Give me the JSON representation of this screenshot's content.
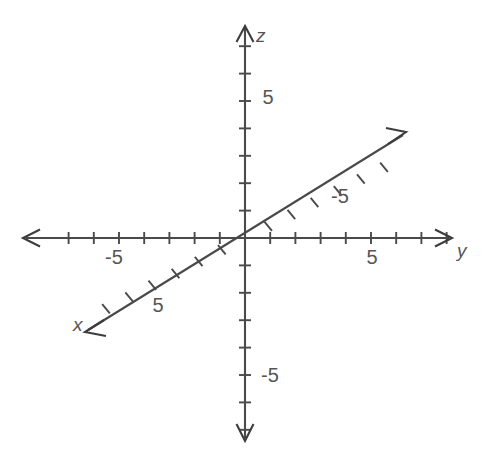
{
  "figure": {
    "background_color": "#ffffff",
    "line_color": "#4a4a4a",
    "label_color": "#555555",
    "width": 493,
    "height": 469
  },
  "chart_data": {
    "type": "line",
    "subtitle": "",
    "xlabel": "x",
    "ylabel": "y",
    "zlabel": "z",
    "grid": false,
    "legend": false,
    "origin": {
      "x": 245,
      "y": 238,
      "label": ""
    },
    "tick_step": 1,
    "labeled_ticks": [
      5,
      -5
    ],
    "axes": [
      {
        "name": "z",
        "label": "z",
        "label_position": {
          "x": 256,
          "y": 42
        },
        "orientation": "vertical",
        "direction_positive": "up",
        "start": {
          "x": 245,
          "y": 438
        },
        "end": {
          "x": 245,
          "y": 28
        },
        "arrow_both_ends": true,
        "tick_spacing_px": 27.4,
        "ticks_positive": 7,
        "ticks_negative": 7,
        "tick_half_length": 6,
        "tick_labels": [
          {
            "value": 5,
            "text": "5",
            "x": 268,
            "y": 104
          },
          {
            "value": -5,
            "text": "-5",
            "x": 270,
            "y": 382
          }
        ]
      },
      {
        "name": "y",
        "label": "y",
        "label_position": {
          "x": 457,
          "y": 257
        },
        "orientation": "horizontal",
        "direction_positive": "right",
        "start": {
          "x": 26,
          "y": 238
        },
        "end": {
          "x": 449,
          "y": 238
        },
        "arrow_both_ends": true,
        "tick_spacing_px": 25.2,
        "ticks_positive": 8,
        "ticks_negative": 7,
        "tick_half_length": 6,
        "tick_labels": [
          {
            "value": 5,
            "text": "5",
            "x": 372,
            "y": 264
          },
          {
            "value": -5,
            "text": "-5",
            "x": 114,
            "y": 264
          }
        ]
      },
      {
        "name": "x",
        "label": "x",
        "label_position": {
          "x": 73,
          "y": 331
        },
        "orientation": "diagonal",
        "direction_positive": "down-left",
        "angle_deg": 27,
        "start": {
          "x": 403,
          "y": 135
        },
        "end": {
          "x": 88,
          "y": 330
        },
        "arrow_both_ends": true,
        "tick_spacing_px": 26,
        "ticks_positive": 6,
        "ticks_negative": 6,
        "tick_half_length": 6,
        "tick_labels": [
          {
            "value": 5,
            "text": "5",
            "x": 158,
            "y": 312
          },
          {
            "value": -5,
            "text": "-5",
            "x": 340,
            "y": 203
          }
        ]
      }
    ]
  }
}
